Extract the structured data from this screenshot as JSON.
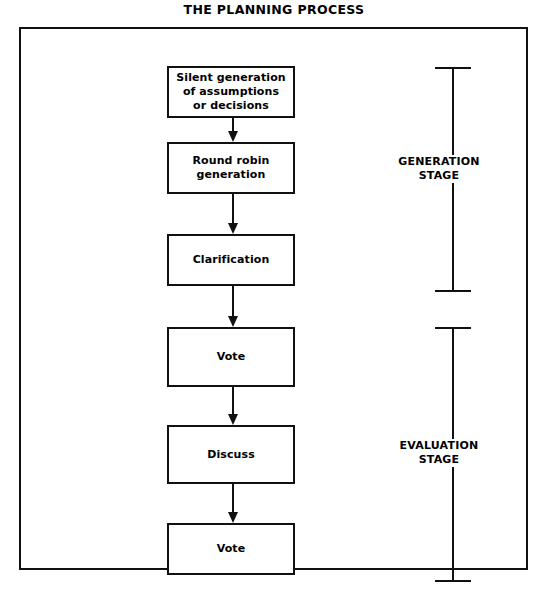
{
  "title": "THE PLANNING PROCESS",
  "diagram": {
    "type": "flowchart",
    "orientation": "vertical",
    "colors": {
      "line": "#111111",
      "background": "#ffffff",
      "text": "#000000"
    },
    "steps": [
      {
        "id": "step-1",
        "label": "Silent generation\nof assumptions\nor decisions",
        "stage": "GENERATION STAGE"
      },
      {
        "id": "step-2",
        "label": "Round robin\ngeneration",
        "stage": "GENERATION STAGE"
      },
      {
        "id": "step-3",
        "label": "Clarification",
        "stage": "GENERATION STAGE"
      },
      {
        "id": "step-4",
        "label": "Vote",
        "stage": "EVALUATION STAGE"
      },
      {
        "id": "step-5",
        "label": "Discuss",
        "stage": "EVALUATION STAGE"
      },
      {
        "id": "step-6",
        "label": "Vote",
        "stage": "EVALUATION STAGE"
      }
    ],
    "connectors": [
      {
        "from": "step-1",
        "to": "step-2",
        "kind": "arrow-down"
      },
      {
        "from": "step-2",
        "to": "step-3",
        "kind": "arrow-down"
      },
      {
        "from": "step-3",
        "to": "step-4",
        "kind": "arrow-down"
      },
      {
        "from": "step-4",
        "to": "step-5",
        "kind": "arrow-down"
      },
      {
        "from": "step-5",
        "to": "step-6",
        "kind": "arrow-down"
      }
    ],
    "stages": [
      {
        "id": "stage-generation",
        "label": "GENERATION\nSTAGE",
        "covers": [
          "step-1",
          "step-2",
          "step-3"
        ]
      },
      {
        "id": "stage-evaluation",
        "label": "EVALUATION\nSTAGE",
        "covers": [
          "step-4",
          "step-5",
          "step-6"
        ]
      }
    ]
  }
}
